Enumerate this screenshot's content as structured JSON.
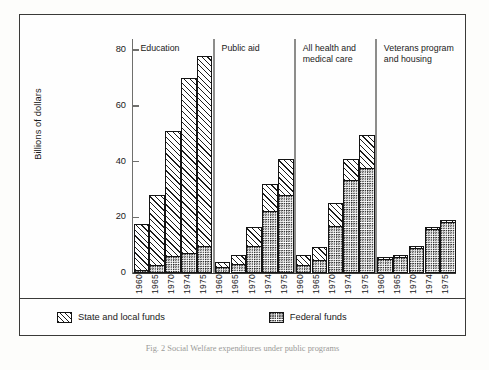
{
  "chart_data": {
    "type": "bar",
    "title": "",
    "subtitle": "",
    "xlabel": "",
    "ylabel": "Billions of dollars",
    "ylim": [
      0,
      84
    ],
    "yticks": [
      0,
      20,
      40,
      60,
      80
    ],
    "ytick_labels": [
      "0",
      "20",
      "40",
      "60",
      "80"
    ],
    "grid": false,
    "stacked": true,
    "legend_position": "bottom",
    "categories": [
      "1960",
      "1965",
      "1970",
      "1974",
      "1975"
    ],
    "series": [
      {
        "name": "State and local funds",
        "pattern": "diagonal-hatch"
      },
      {
        "name": "Federal funds",
        "pattern": "dot-stipple"
      }
    ],
    "groups": [
      {
        "name": "Education",
        "bars": [
          {
            "year": "1960",
            "federal": 0.7,
            "state_local": 16.8,
            "total": 17.5
          },
          {
            "year": "1965",
            "federal": 2.5,
            "state_local": 25.5,
            "total": 28.0
          },
          {
            "year": "1970",
            "federal": 5.8,
            "state_local": 45.2,
            "total": 51.0
          },
          {
            "year": "1974",
            "federal": 7.0,
            "state_local": 63.0,
            "total": 70.0
          },
          {
            "year": "1975",
            "federal": 9.5,
            "state_local": 68.5,
            "total": 78.0
          }
        ]
      },
      {
        "name": "Public aid",
        "bars": [
          {
            "year": "1960",
            "federal": 2.1,
            "state_local": 2.0,
            "total": 4.1
          },
          {
            "year": "1965",
            "federal": 3.3,
            "state_local": 3.0,
            "total": 6.3
          },
          {
            "year": "1970",
            "federal": 9.6,
            "state_local": 6.9,
            "total": 16.5
          },
          {
            "year": "1974",
            "federal": 22.5,
            "state_local": 9.5,
            "total": 32.0
          },
          {
            "year": "1975",
            "federal": 28.0,
            "state_local": 13.0,
            "total": 41.0
          }
        ]
      },
      {
        "name": "All health and\nmedical care",
        "bars": [
          {
            "year": "1960",
            "federal": 3.0,
            "state_local": 3.4,
            "total": 6.4
          },
          {
            "year": "1965",
            "federal": 4.5,
            "state_local": 5.0,
            "total": 9.5
          },
          {
            "year": "1970",
            "federal": 17.0,
            "state_local": 8.0,
            "total": 25.0
          },
          {
            "year": "1974",
            "federal": 33.5,
            "state_local": 7.5,
            "total": 41.0
          },
          {
            "year": "1975",
            "federal": 38.0,
            "state_local": 11.5,
            "total": 49.5
          }
        ]
      },
      {
        "name": "Veterans program\nand housing",
        "bars": [
          {
            "year": "1960",
            "federal": 5.5,
            "state_local": 0.3,
            "total": 5.8
          },
          {
            "year": "1965",
            "federal": 6.2,
            "state_local": 0.3,
            "total": 6.5
          },
          {
            "year": "1970",
            "federal": 9.4,
            "state_local": 0.4,
            "total": 9.8
          },
          {
            "year": "1974",
            "federal": 16.1,
            "state_local": 0.4,
            "total": 16.5
          },
          {
            "year": "1975",
            "federal": 18.5,
            "state_local": 0.5,
            "total": 19.0
          }
        ]
      }
    ]
  },
  "axis": {
    "y_label": "Billions of dollars",
    "y_ticks": [
      "80",
      "60",
      "40",
      "20",
      "0"
    ]
  },
  "legend": {
    "state_local_label": "State and local funds",
    "federal_label": "Federal funds"
  },
  "caption": {
    "text": "Fig. 2   Social Welfare expenditures under public programs"
  },
  "colors": {
    "ink": "#141414",
    "frame": "#3a3a38",
    "axis": "#6f6f6d",
    "separator": "#8d8d8b",
    "paper": "#fefefe"
  }
}
